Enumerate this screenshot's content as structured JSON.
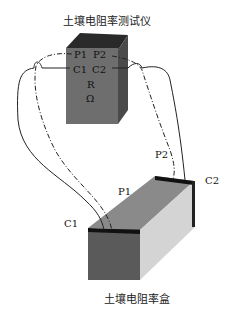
{
  "diagram": {
    "meter": {
      "title": "土壤电阻率测试仪",
      "terminals": {
        "p1": "P1",
        "p2": "P2",
        "c1": "C1",
        "c2": "C2"
      },
      "symbol_r": "R",
      "symbol_ohm": "Ω"
    },
    "box": {
      "title": "土壤电阻率盒",
      "labels": {
        "c1": "C1",
        "p1": "P1",
        "p2": "P2",
        "c2": "C2"
      }
    },
    "colors": {
      "meter_front": "#6e6e6e",
      "meter_top": "#2a2a2a",
      "meter_side": "#4a4a4a",
      "box_front": "#5a5a5a",
      "box_top": "#8a8a8a",
      "box_side": "#cfcfcf",
      "electrode": "#111111",
      "wire": "#222222"
    }
  }
}
